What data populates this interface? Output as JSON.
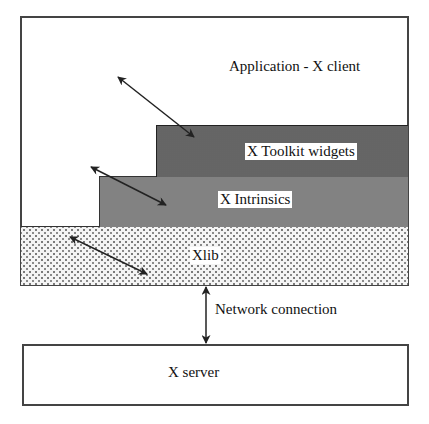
{
  "diagram": {
    "title": "",
    "layers": [
      {
        "id": "application",
        "label": "Application - X client"
      },
      {
        "id": "toolkit",
        "label": "X Toolkit widgets"
      },
      {
        "id": "intrinsics",
        "label": "X Intrinsics"
      },
      {
        "id": "xlib",
        "label": "Xlib"
      },
      {
        "id": "server",
        "label": "X server"
      }
    ],
    "connections": [
      {
        "id": "network",
        "label": "Network connection",
        "from": "xlib",
        "to": "server",
        "type": "bidirectional"
      },
      {
        "id": "app-toolkit",
        "label": "",
        "from": "application",
        "to": "toolkit",
        "type": "bidirectional"
      },
      {
        "id": "app-intrinsics",
        "label": "",
        "from": "application",
        "to": "intrinsics",
        "type": "bidirectional"
      },
      {
        "id": "app-xlib",
        "label": "",
        "from": "application",
        "to": "xlib",
        "type": "bidirectional"
      }
    ],
    "colors": {
      "toolkit_fill": "#2a2a2a",
      "intrinsics_fill": "#c2c2c2",
      "xlib_fill": "#f4f4f4",
      "border": "#444444"
    }
  }
}
